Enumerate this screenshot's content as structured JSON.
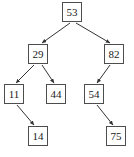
{
  "figure": {
    "type": "binary-search-tree-diagram",
    "width": 134,
    "height": 157,
    "background_color": "#ffffff",
    "node_border_color": "#4d4d4d",
    "node_fill_color": "#ffffff",
    "text_color": "#1a1a1a",
    "edge_color": "#333333"
  },
  "nodes": [
    {
      "id": "n53",
      "label": "53",
      "x": 62,
      "y": 2,
      "depth": 0
    },
    {
      "id": "n29",
      "label": "29",
      "x": 28,
      "y": 44,
      "depth": 1
    },
    {
      "id": "n82",
      "label": "82",
      "x": 104,
      "y": 44,
      "depth": 1
    },
    {
      "id": "n11",
      "label": "11",
      "x": 4,
      "y": 84,
      "depth": 2
    },
    {
      "id": "n44",
      "label": "44",
      "x": 46,
      "y": 84,
      "depth": 2
    },
    {
      "id": "n54",
      "label": "54",
      "x": 84,
      "y": 84,
      "depth": 2
    },
    {
      "id": "n14",
      "label": "14",
      "x": 28,
      "y": 126,
      "depth": 3
    },
    {
      "id": "n75",
      "label": "75",
      "x": 106,
      "y": 126,
      "depth": 3
    }
  ],
  "edges": [
    {
      "from": "n53",
      "to": "n29",
      "x1": 70,
      "y1": 23,
      "x2": 42,
      "y2": 43
    },
    {
      "from": "n53",
      "to": "n82",
      "x1": 76,
      "y1": 23,
      "x2": 110,
      "y2": 43
    },
    {
      "from": "n29",
      "to": "n11",
      "x1": 34,
      "y1": 65,
      "x2": 16,
      "y2": 83
    },
    {
      "from": "n29",
      "to": "n44",
      "x1": 42,
      "y1": 65,
      "x2": 54,
      "y2": 83
    },
    {
      "from": "n82",
      "to": "n54",
      "x1": 110,
      "y1": 65,
      "x2": 97,
      "y2": 83
    },
    {
      "from": "n11",
      "to": "n14",
      "x1": 17,
      "y1": 105,
      "x2": 34,
      "y2": 125
    },
    {
      "from": "n54",
      "to": "n75",
      "x1": 97,
      "y1": 105,
      "x2": 113,
      "y2": 125
    }
  ]
}
